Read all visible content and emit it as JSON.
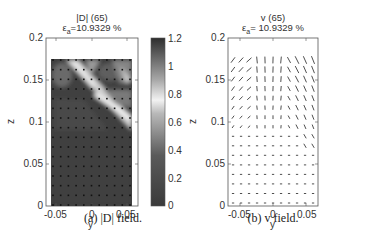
{
  "chart_data": [
    {
      "type": "heatmap",
      "panel": "a",
      "title": "|D| (65)",
      "subtitle": "ε_a = 10.9329 %",
      "subtitle_prefix": "ε",
      "subtitle_sub": "a",
      "subtitle_value": "=10.9329 %",
      "xlabel": "y",
      "ylabel": "z",
      "xlim": [
        -0.07,
        0.07
      ],
      "ylim": [
        0,
        0.2
      ],
      "xticks": [
        "-0.05",
        "0",
        "0.05"
      ],
      "yticks": [
        "0",
        "0.05",
        "0.1",
        "0.15",
        "0.2"
      ],
      "colorbar": {
        "ticks": [
          "0",
          "0.2",
          "0.4",
          "0.6",
          "0.8",
          "1",
          "1.2"
        ],
        "range": [
          0,
          1.2
        ],
        "colormap": "gray (dark=0, light≈0.75, dark=1.2)"
      },
      "data_region": {
        "y": [
          -0.062,
          0.062
        ],
        "z": [
          0,
          0.175
        ]
      },
      "grid_points": {
        "ny": 11,
        "nz": 16
      },
      "features": "Mostly dark (low |D|) field; bright diagonal band from upper-left (y≈-0.04, z≈0.17) to right (y≈0.06, z≈0.10), plus lighter patches near the top-right.",
      "caption": "(a) |D| field."
    },
    {
      "type": "quiver",
      "panel": "b",
      "title": "v (65)",
      "subtitle": "ε_a = 10.9329 %",
      "subtitle_prefix": "ε",
      "subtitle_sub": "a",
      "subtitle_value": "= 10.9329 %",
      "xlabel": "y",
      "ylabel": "z",
      "xlim": [
        -0.07,
        0.07
      ],
      "ylim": [
        0,
        0.2
      ],
      "xticks": [
        "-0.05",
        "0",
        "0.05"
      ],
      "yticks": [
        "0",
        "0.05",
        "0.1",
        "0.15",
        "0.2"
      ],
      "grid_points": {
        "ny": 11,
        "nz": 16
      },
      "features": "Small vectors near bottom (near-zero velocity); larger arrows in upper region: pointing up-right at left-top, mostly vertical at center-top, pointing down-right/diagonal on right side.",
      "caption": "(b) v field."
    }
  ],
  "panels": {
    "a": {
      "title": "|D| (65)",
      "eps": "ε",
      "eps_sub": "a",
      "eps_value": "=10.9329 %",
      "yticks": [
        "0.2",
        "0.15",
        "0.1",
        "0.05",
        "0"
      ],
      "xticks": [
        "-0.05",
        "0",
        "0.05"
      ],
      "xlabel": "y",
      "ylabel": "z",
      "cbar_ticks": [
        "1.2",
        "1",
        "0.8",
        "0.6",
        "0.4",
        "0.2",
        "0"
      ],
      "caption": "(a) |D| field."
    },
    "b": {
      "title": "v (65)",
      "eps": "ε",
      "eps_sub": "a",
      "eps_value": "= 10.9329 %",
      "yticks": [
        "0.2",
        "0.15",
        "0.1",
        "0.05",
        "0"
      ],
      "xticks": [
        "-0.05",
        "0",
        "0.05"
      ],
      "xlabel": "y",
      "ylabel": "z",
      "caption": "(b) v field."
    }
  },
  "colors": {
    "dark": "#3a3a3a",
    "mid": "#6e6e6e",
    "light": "#e8e8e8",
    "axis": "#555555",
    "arrow": "#222222"
  }
}
